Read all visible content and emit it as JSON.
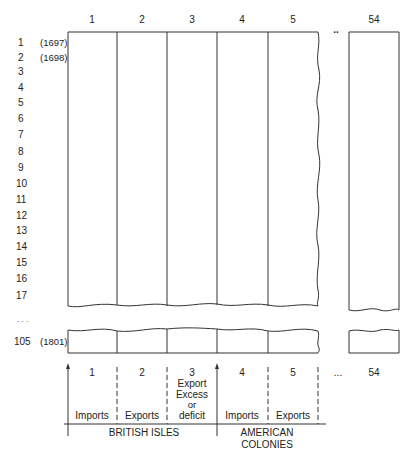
{
  "diagram": {
    "column_headers": [
      "1",
      "2",
      "3",
      "4",
      "5",
      "54"
    ],
    "column_ellipsis": "..",
    "rows": [
      {
        "label": "1",
        "year": "(1697)"
      },
      {
        "label": "2",
        "year": "(1698)"
      },
      {
        "label": "3"
      },
      {
        "label": "4"
      },
      {
        "label": "5"
      },
      {
        "label": "6"
      },
      {
        "label": "7"
      },
      {
        "label": "8"
      },
      {
        "label": "9"
      },
      {
        "label": "10"
      },
      {
        "label": "11"
      },
      {
        "label": "12"
      },
      {
        "label": "13"
      },
      {
        "label": "14"
      },
      {
        "label": "15"
      },
      {
        "label": "16"
      },
      {
        "label": "17"
      }
    ],
    "row_ellipsis": ". . .",
    "last_row": {
      "label": "105",
      "year": "(1801)"
    },
    "legend": {
      "columns": [
        {
          "number": "1",
          "label": "Imports"
        },
        {
          "number": "2",
          "label": "Exports"
        },
        {
          "number": "3",
          "label_lines": [
            "Export",
            "Excess",
            "or",
            "deficit"
          ]
        },
        {
          "number": "4",
          "label": "Imports"
        },
        {
          "number": "5",
          "label": "Exports"
        },
        {
          "number": "54",
          "label": ""
        }
      ],
      "ellipsis": "...",
      "groups": [
        {
          "label": "BRITISH ISLES"
        },
        {
          "label_lines": [
            "AMERICAN",
            "COLONIES"
          ]
        }
      ]
    }
  }
}
